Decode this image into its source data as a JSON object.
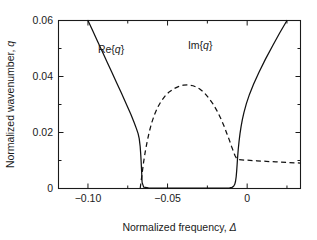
{
  "figure": {
    "background_color": "#ffffff",
    "foreground_color": "#1a1a1a"
  },
  "axes": {
    "x_title_prefix": "Normalized frequency, ",
    "x_title_symbol": "Δ",
    "y_title_prefix": "Normalized wavenumber, ",
    "y_title_symbol": "q",
    "x_tick_labels": [
      "−0.10",
      "−0.05",
      "0"
    ],
    "y_tick_labels": [
      "0",
      "0.02",
      "0.04",
      "0.06"
    ]
  },
  "labels": {
    "re_label": "Re{q}",
    "im_label": "Im{q}"
  },
  "chart_data": {
    "type": "line",
    "title": "",
    "xlabel": "Normalized frequency, Δ",
    "ylabel": "Normalized wavenumber, q",
    "xlim": [
      -0.1185,
      0.0335
    ],
    "ylim": [
      0,
      0.06
    ],
    "x_major_ticks": [
      -0.1,
      -0.05,
      0
    ],
    "x_minor_ticks": [
      -0.075,
      -0.025,
      0.025
    ],
    "y_major_ticks": [
      0,
      0.02,
      0.04,
      0.06
    ],
    "y_minor_ticks": [
      0.01,
      0.03,
      0.05
    ],
    "grid": false,
    "legend": "inline-annotations",
    "series": [
      {
        "name": "Re{q}",
        "style": "solid",
        "annotation": "Re{q}",
        "annotation_x": -0.0855,
        "annotation_y": 0.0485,
        "x": [
          -0.1,
          -0.097,
          -0.094,
          -0.091,
          -0.088,
          -0.085,
          -0.082,
          -0.079,
          -0.076,
          -0.073,
          -0.071,
          -0.0695,
          -0.0685,
          -0.0678,
          -0.0672,
          -0.0668,
          -0.0665,
          -0.0662,
          -0.066,
          -0.065,
          -0.062,
          -0.056,
          -0.048,
          -0.04,
          -0.03,
          -0.02,
          -0.014,
          -0.011,
          -0.0095,
          -0.0085,
          -0.0078,
          -0.0073,
          -0.0069,
          -0.0066,
          -0.0063,
          -0.006,
          -0.0056,
          -0.0051,
          -0.0045,
          -0.0038,
          -0.003,
          -0.002,
          -0.0005,
          0.0015,
          0.004,
          0.0075,
          0.0115,
          0.016,
          0.0205,
          0.025
        ],
        "y": [
          0.06,
          0.0563,
          0.0526,
          0.0489,
          0.0452,
          0.0415,
          0.0378,
          0.0341,
          0.0303,
          0.0264,
          0.0236,
          0.0213,
          0.0196,
          0.0178,
          0.015,
          0.0118,
          0.0086,
          0.005,
          0.0022,
          0.0005,
          0.0002,
          0.0001,
          0.0001,
          0.0001,
          0.0001,
          0.0001,
          0.0001,
          0.0002,
          0.0004,
          0.0008,
          0.0015,
          0.0026,
          0.0042,
          0.0062,
          0.0086,
          0.0112,
          0.014,
          0.0168,
          0.0196,
          0.0222,
          0.0247,
          0.0272,
          0.0303,
          0.0337,
          0.0372,
          0.0416,
          0.0462,
          0.051,
          0.0556,
          0.06
        ]
      },
      {
        "name": "Im{q}",
        "style": "dashed",
        "annotation": "Im{q}",
        "annotation_x": -0.0295,
        "annotation_y": 0.0498,
        "x": [
          -0.0672,
          -0.0665,
          -0.0658,
          -0.065,
          -0.064,
          -0.0628,
          -0.0615,
          -0.06,
          -0.0582,
          -0.0562,
          -0.054,
          -0.0516,
          -0.049,
          -0.0462,
          -0.0432,
          -0.04,
          -0.0368,
          -0.034,
          -0.0318,
          -0.03,
          -0.0282,
          -0.0262,
          -0.024,
          -0.0216,
          -0.0192,
          -0.0168,
          -0.0146,
          -0.0126,
          -0.011,
          -0.0098,
          -0.009,
          -0.0084,
          -0.0079,
          -0.0075,
          -0.0071,
          -0.0068,
          -0.0065,
          -0.0062,
          -0.0058,
          0.0,
          0.006,
          0.012,
          0.018,
          0.025,
          0.0335
        ],
        "y": [
          0.0,
          0.003,
          0.0062,
          0.0096,
          0.0132,
          0.0168,
          0.0202,
          0.0234,
          0.0264,
          0.029,
          0.0312,
          0.033,
          0.0345,
          0.0356,
          0.0364,
          0.0369,
          0.037,
          0.0367,
          0.0362,
          0.0356,
          0.0348,
          0.0337,
          0.0322,
          0.0303,
          0.028,
          0.0253,
          0.0224,
          0.0194,
          0.017,
          0.015,
          0.0138,
          0.0128,
          0.0121,
          0.0116,
          0.0112,
          0.0109,
          0.0107,
          0.0105,
          0.0103,
          0.0101,
          0.0099,
          0.0097,
          0.0095,
          0.0093,
          0.0091
        ]
      }
    ]
  }
}
